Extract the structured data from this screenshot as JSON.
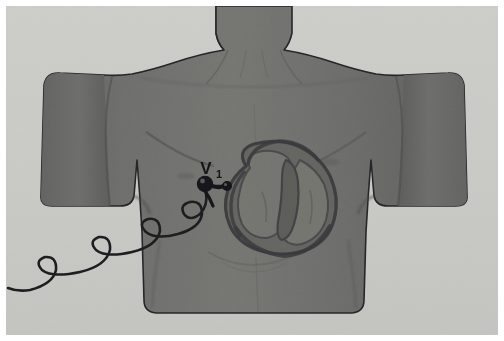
{
  "figure": {
    "title": "V1 precordial electrode placement on anterior chest",
    "type": "medical-illustration",
    "width": 504,
    "height": 341
  },
  "labels": {
    "electrode_label": "V",
    "electrode_label_subscript": "1",
    "electrode_label_full": "V₁"
  },
  "colors": {
    "background": "#c9cac6",
    "frame_border": "#ffffff",
    "skin_base": "#6e6f6c",
    "skin_shadow": "#5d5e5b",
    "skin_highlight": "#7c7d79",
    "outline": "#26262a",
    "heart_outline": "#3b3b3d",
    "heart_wall": "#5a5a58",
    "heart_chamber": "#6b6c69",
    "electrode": "#18181a",
    "lead_wire": "#1d1d20",
    "label_text": "#1a1a1c"
  },
  "anatomy": {
    "parts": [
      {
        "name": "neck",
        "description": "neck and chin base at top center"
      },
      {
        "name": "left-shoulder",
        "description": "subject's right shoulder, image left"
      },
      {
        "name": "right-shoulder",
        "description": "subject's left shoulder, image right"
      },
      {
        "name": "left-arm",
        "description": "upper arm stump, image left"
      },
      {
        "name": "right-arm",
        "description": "upper arm stump, image right"
      },
      {
        "name": "chest",
        "description": "anterior thorax with pectoral contour"
      },
      {
        "name": "abdomen",
        "description": "lower torso tapering to waist"
      },
      {
        "name": "heart",
        "description": "four-chamber heart cross-section overlay on chest"
      }
    ]
  },
  "device": {
    "electrode_name": "v1-electrode",
    "electrode_position": {
      "x": 205,
      "y": 185
    },
    "lead_wire_name": "ecg-lead-wire",
    "lead_description": "coiled ECG lead wire running from electrode down and to the lower left off-frame"
  }
}
